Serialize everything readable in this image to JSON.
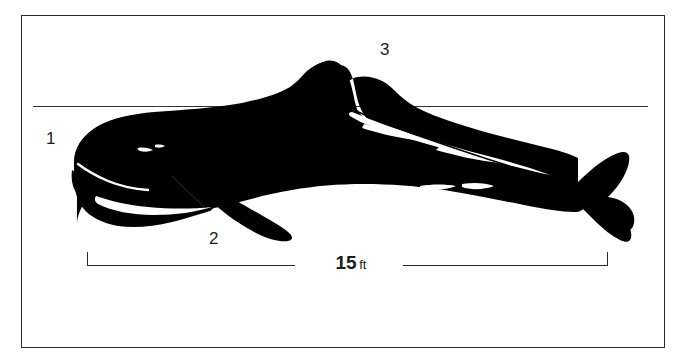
{
  "figure": {
    "background_color": "#ffffff",
    "ink_color": "#000000",
    "frame_color": "#2a2a2a",
    "width": 688,
    "height": 364
  },
  "callouts": [
    {
      "id": "1",
      "label": "1",
      "name": "callout-1-head"
    },
    {
      "id": "2",
      "label": "2",
      "name": "callout-2-flipper"
    },
    {
      "id": "3",
      "label": "3",
      "name": "callout-3-dorsal-fin"
    }
  ],
  "waterline": {
    "name": "reference-waterline",
    "x1": 33,
    "x2": 648,
    "y": 106
  },
  "scale": {
    "value": "15",
    "unit": "ft",
    "caption": "15 ft",
    "x_left": 87,
    "x_right": 608,
    "y": 265
  }
}
